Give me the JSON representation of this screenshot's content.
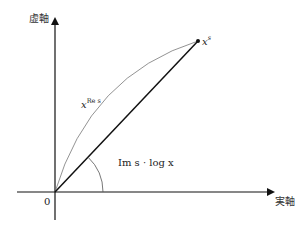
{
  "diagram": {
    "axes": {
      "y_axis_label": "虚軸",
      "x_axis_label": "実軸",
      "origin_label": "0"
    },
    "point_label": {
      "base": "x",
      "exponent": "s"
    },
    "curve_label": {
      "base": "x",
      "exponent": "Re s"
    },
    "angle_label": "Im s · log x",
    "colors": {
      "axis": "#111111",
      "segment": "#111111",
      "curve": "#777777",
      "arc": "#555555",
      "background": "#ffffff"
    },
    "geometry": {
      "origin": [
        55,
        192
      ],
      "point": [
        198,
        41
      ],
      "arc_radius": 48
    }
  }
}
